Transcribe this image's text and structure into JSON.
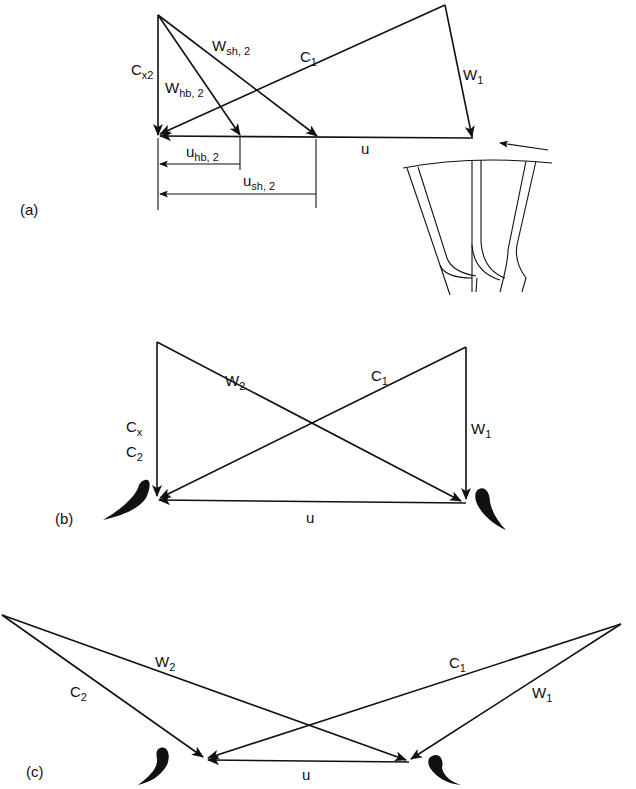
{
  "panels": [
    {
      "id": "a",
      "label": "(a)",
      "vectors": {
        "cx2": {
          "main": "C",
          "sub": "x2"
        },
        "whb2": {
          "main": "W",
          "sub": "hb, 2"
        },
        "wsh2": {
          "main": "W",
          "sub": "sh, 2"
        },
        "c1": {
          "main": "C",
          "sub": "1"
        },
        "w1": {
          "main": "W",
          "sub": "1"
        },
        "u": {
          "main": "u"
        },
        "uhb2": {
          "main": "u",
          "sub": "hb, 2"
        },
        "ush2": {
          "main": "u",
          "sub": "sh, 2"
        }
      },
      "inset": "radial-inflow rotor blade passage with rotation arrow"
    },
    {
      "id": "b",
      "label": "(b)",
      "vectors": {
        "w2": {
          "main": "W",
          "sub": "2"
        },
        "c1": {
          "main": "C",
          "sub": "1"
        },
        "cx": {
          "main": "C",
          "sub": "x"
        },
        "c2": {
          "main": "C",
          "sub": "2"
        },
        "w1": {
          "main": "W",
          "sub": "1"
        },
        "u": {
          "main": "u"
        }
      }
    },
    {
      "id": "c",
      "label": "(c)",
      "vectors": {
        "w2": {
          "main": "W",
          "sub": "2"
        },
        "c2": {
          "main": "C",
          "sub": "2"
        },
        "c1": {
          "main": "C",
          "sub": "1"
        },
        "w1": {
          "main": "W",
          "sub": "1"
        },
        "u": {
          "main": "u"
        }
      }
    }
  ],
  "colors": {
    "ink": "#111111",
    "background": "#ffffff"
  }
}
